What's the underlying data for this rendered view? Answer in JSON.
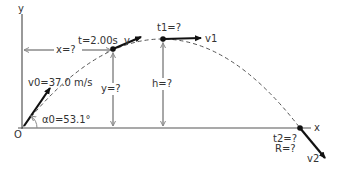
{
  "diagram": {
    "type": "projectile-motion",
    "axes": {
      "x_label": "x",
      "y_label": "y",
      "origin_label": "O"
    },
    "launch": {
      "velocity_label": "v0=37.0 m/s",
      "angle_label": "α0=53.1°"
    },
    "point_t": {
      "time_label": "t=2.00s",
      "velocity_label": "v",
      "x_label": "x=?",
      "y_label": "y=?"
    },
    "apex": {
      "time_label": "t1=?",
      "velocity_label": "v1",
      "height_label": "h=?"
    },
    "landing": {
      "time_label": "t2=?",
      "range_label": "R=?",
      "velocity_label": "v2"
    },
    "colors": {
      "background": "#ffffff",
      "vector": "#111111",
      "guide": "#8a8a8a",
      "trajectory": "#555555"
    }
  }
}
